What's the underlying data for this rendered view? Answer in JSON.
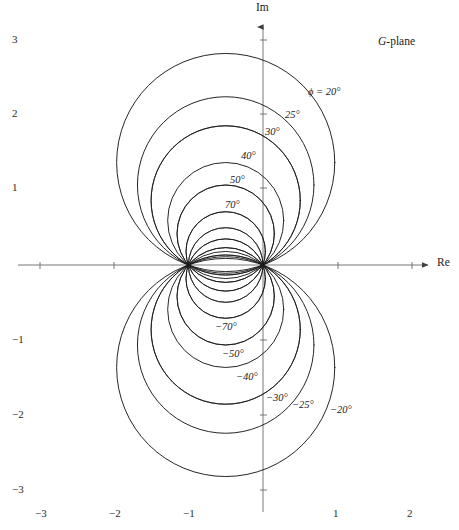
{
  "figure": {
    "plane_label_italic": "G",
    "plane_label_rest": "-plane",
    "axis_im_label": "Im",
    "axis_re_label": "Re"
  },
  "axes": {
    "x_ticks": [
      {
        "value": -3,
        "label": "−3",
        "px": 40
      },
      {
        "value": -2,
        "label": "−2",
        "px": 114
      },
      {
        "value": -1,
        "label": "−1",
        "px": 188
      },
      {
        "value": 1,
        "label": "1",
        "px": 338
      },
      {
        "value": 2,
        "label": "2",
        "px": 412
      }
    ],
    "y_ticks": [
      {
        "value": 3,
        "label": "3",
        "px": 40
      },
      {
        "value": 2,
        "label": "2",
        "px": 114
      },
      {
        "value": 1,
        "label": "1",
        "px": 188
      },
      {
        "value": -1,
        "label": "−1",
        "px": 340
      },
      {
        "value": -2,
        "label": "−2",
        "px": 415
      },
      {
        "value": -3,
        "label": "−3",
        "px": 490
      }
    ]
  },
  "chart_data": {
    "type": "line",
    "title": "G-plane",
    "xlabel": "Re",
    "ylabel": "Im",
    "xlim": [
      -3.53,
      2.63
    ],
    "ylim": [
      -3.55,
      3.56
    ],
    "grid": false,
    "legend": "inline-curve-labels",
    "fixed_points": [
      [
        -1,
        0
      ],
      [
        0,
        0
      ]
    ],
    "curve_family": {
      "center_x": -0.5,
      "center_y_formula": "0.5*cot(phi)",
      "radius_formula": "0.5/sin(phi)"
    },
    "series": [
      {
        "name": "ϕ = 20°",
        "phi": 20,
        "center": [
          -0.5,
          1.3737
        ],
        "radius": 1.4619,
        "apex": [
          -0.5,
          2.8356
        ],
        "re_extent": [
          -1.9619,
          0.9619
        ],
        "labeled": true,
        "label_text": "ϕ = 20°",
        "label_px": [
          308,
          87
        ]
      },
      {
        "name": "25°",
        "phi": 25,
        "center": [
          -0.5,
          1.0723
        ],
        "radius": 1.1831,
        "apex": [
          -0.5,
          2.2554
        ],
        "re_extent": [
          -1.6831,
          0.6831
        ],
        "labeled": true,
        "label_text": "25°",
        "label_px": [
          285,
          110
        ]
      },
      {
        "name": "30°",
        "phi": 30,
        "center": [
          -0.5,
          0.866
        ],
        "radius": 1.0,
        "apex": [
          -0.5,
          1.866
        ],
        "re_extent": [
          -1.5,
          0.5
        ],
        "labeled": true,
        "label_text": "30°",
        "label_px": [
          265,
          127
        ]
      },
      {
        "name": "40°",
        "phi": 40,
        "center": [
          -0.5,
          0.5959
        ],
        "radius": 0.7779,
        "apex": [
          -0.5,
          1.3738
        ],
        "re_extent": [
          -1.2779,
          0.2779
        ],
        "labeled": true,
        "label_text": "40°",
        "label_px": [
          241,
          151
        ]
      },
      {
        "name": "50°",
        "phi": 50,
        "center": [
          -0.5,
          0.4196
        ],
        "radius": 0.6527,
        "apex": [
          -0.5,
          1.0723
        ],
        "re_extent": [
          -1.1527,
          0.1527
        ],
        "labeled": true,
        "label_text": "50°",
        "label_px": [
          230,
          175
        ]
      },
      {
        "name": "70°",
        "phi": 70,
        "center": [
          -0.5,
          0.182
        ],
        "radius": 0.5321,
        "apex": [
          -0.5,
          0.7141
        ],
        "re_extent": [
          -1.0321,
          0.0321
        ],
        "labeled": true,
        "label_text": "70°",
        "label_px": [
          225,
          200
        ]
      },
      {
        "name": "90°",
        "phi": 90,
        "center": [
          -0.5,
          0.0
        ],
        "radius": 0.5,
        "apex": [
          -0.5,
          0.5
        ],
        "re_extent": [
          -1.0,
          0.0
        ],
        "labeled": false
      },
      {
        "name": "110°",
        "phi": 110,
        "center": [
          -0.5,
          -0.182
        ],
        "radius": 0.5321,
        "apex": [
          -0.5,
          0.3501
        ],
        "re_extent": [
          -1.0321,
          0.0321
        ],
        "labeled": false
      },
      {
        "name": "130°",
        "phi": 130,
        "center": [
          -0.5,
          -0.4196
        ],
        "radius": 0.6527,
        "apex": [
          -0.5,
          0.2331
        ],
        "re_extent": [
          -1.1527,
          0.1527
        ],
        "labeled": false
      },
      {
        "name": "150°",
        "phi": 150,
        "center": [
          -0.5,
          -0.866
        ],
        "radius": 1.0,
        "apex": [
          -0.5,
          0.134
        ],
        "re_extent": [
          -1.5,
          0.5
        ],
        "labeled": false
      },
      {
        "name": "−20°",
        "phi": -20,
        "center": [
          -0.5,
          -1.3737
        ],
        "radius": 1.4619,
        "apex": [
          -0.5,
          -2.8356
        ],
        "re_extent": [
          -1.9619,
          0.9619
        ],
        "labeled": true,
        "label_text": "−20°",
        "label_px": [
          330,
          405
        ]
      },
      {
        "name": "−25°",
        "phi": -25,
        "center": [
          -0.5,
          -1.0723
        ],
        "radius": 1.1831,
        "apex": [
          -0.5,
          -2.2554
        ],
        "re_extent": [
          -1.6831,
          0.6831
        ],
        "labeled": true,
        "label_text": "−25°",
        "label_px": [
          292,
          400
        ]
      },
      {
        "name": "−30°",
        "phi": -30,
        "center": [
          -0.5,
          -0.866
        ],
        "radius": 1.0,
        "apex": [
          -0.5,
          -1.866
        ],
        "re_extent": [
          -1.5,
          0.5
        ],
        "labeled": true,
        "label_text": "−30°",
        "label_px": [
          266,
          393
        ]
      },
      {
        "name": "−40°",
        "phi": -40,
        "center": [
          -0.5,
          -0.5959
        ],
        "radius": 0.7779,
        "apex": [
          -0.5,
          -1.3738
        ],
        "re_extent": [
          -1.2779,
          0.2779
        ],
        "labeled": true,
        "label_text": "−40°",
        "label_px": [
          236,
          372
        ]
      },
      {
        "name": "−50°",
        "phi": -50,
        "center": [
          -0.5,
          -0.4196
        ],
        "radius": 0.6527,
        "apex": [
          -0.5,
          -1.0723
        ],
        "re_extent": [
          -1.1527,
          0.1527
        ],
        "labeled": true,
        "label_text": "−50°",
        "label_px": [
          222,
          349
        ]
      },
      {
        "name": "−70°",
        "phi": -70,
        "center": [
          -0.5,
          -0.182
        ],
        "radius": 0.5321,
        "apex": [
          -0.5,
          -0.7141
        ],
        "re_extent": [
          -1.0321,
          0.0321
        ],
        "labeled": true,
        "label_text": "−70°",
        "label_px": [
          215,
          322
        ]
      },
      {
        "name": "−90°",
        "phi": -90,
        "center": [
          -0.5,
          0.0
        ],
        "radius": 0.5,
        "apex": [
          -0.5,
          -0.5
        ],
        "re_extent": [
          -1.0,
          0.0
        ],
        "labeled": false
      },
      {
        "name": "−110°",
        "phi": -110,
        "center": [
          -0.5,
          0.182
        ],
        "radius": 0.5321,
        "apex": [
          -0.5,
          -0.3501
        ],
        "re_extent": [
          -1.0321,
          0.0321
        ],
        "labeled": false
      },
      {
        "name": "−130°",
        "phi": -130,
        "center": [
          -0.5,
          0.4196
        ],
        "radius": 0.6527,
        "apex": [
          -0.5,
          -0.2331
        ],
        "re_extent": [
          -1.1527,
          0.1527
        ],
        "labeled": false
      },
      {
        "name": "−150°",
        "phi": -150,
        "center": [
          -0.5,
          0.866
        ],
        "radius": 1.0,
        "apex": [
          -0.5,
          -0.134
        ],
        "re_extent": [
          -1.5,
          0.5
        ],
        "labeled": false
      }
    ]
  },
  "style": {
    "background": "#ffffff",
    "curve_color": "#1a1a1a",
    "axis_color": "#555555",
    "text_color": "#1a1a1a"
  },
  "geometry": {
    "origin_px": [
      263,
      265
    ],
    "px_per_unit": 74.6
  }
}
